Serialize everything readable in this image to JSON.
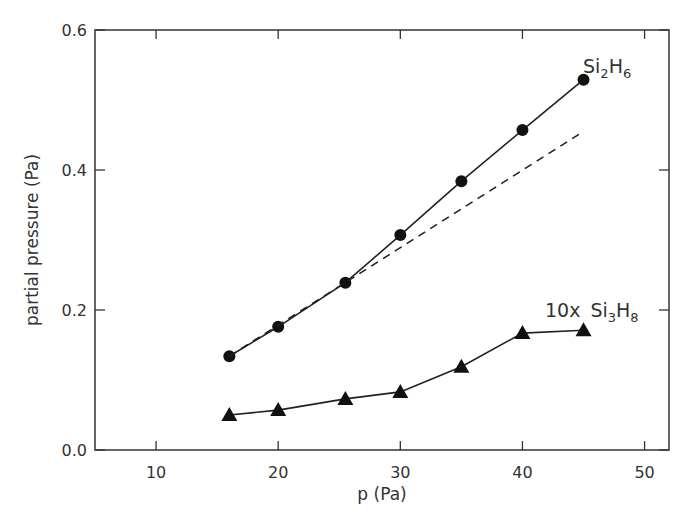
{
  "chart_data": {
    "type": "line",
    "title": "",
    "xlabel": "p (Pa)",
    "ylabel": "partial pressure (Pa)",
    "xlim": [
      5,
      52
    ],
    "ylim": [
      0,
      0.6
    ],
    "xticks": [
      10,
      20,
      30,
      40,
      50
    ],
    "yticks": [
      0.0,
      0.2,
      0.4,
      0.6
    ],
    "xtick_labels": [
      "10",
      "20",
      "30",
      "40",
      "50"
    ],
    "ytick_labels": [
      "0.0",
      "0.2",
      "0.4",
      "0.6"
    ],
    "grid": false,
    "legend": "inline labels",
    "series": [
      {
        "name": "Si2H6",
        "label_main": "Si",
        "label_sub1": "2",
        "label_mid": "H",
        "label_sub2": "6",
        "marker": "circle",
        "line": "solid",
        "x": [
          16,
          20,
          25.5,
          30,
          35,
          40,
          45
        ],
        "values": [
          0.134,
          0.176,
          0.239,
          0.307,
          0.384,
          0.457,
          0.529
        ]
      },
      {
        "name": "10x Si3H8",
        "label_prefix": "10x",
        "label_main": "Si",
        "label_sub1": "3",
        "label_mid": "H",
        "label_sub2": "8",
        "marker": "triangle",
        "line": "solid",
        "x": [
          16,
          20,
          25.5,
          30,
          35,
          40,
          45
        ],
        "values": [
          0.05,
          0.057,
          0.073,
          0.083,
          0.119,
          0.167,
          0.171
        ]
      },
      {
        "name": "linear extrapolation",
        "marker": "none",
        "line": "dashed",
        "x": [
          16,
          45
        ],
        "values": [
          0.134,
          0.455
        ]
      }
    ]
  }
}
